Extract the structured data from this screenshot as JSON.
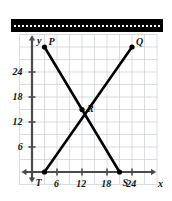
{
  "figure": {
    "title": "",
    "x_axis_label": "x",
    "y_axis_label": "y",
    "redaction_bar": {
      "present": true,
      "color": "#000000",
      "style": "dashed-white-inner-line"
    }
  },
  "chart_data": {
    "type": "scatter",
    "title": "",
    "xlabel": "x",
    "ylabel": "y",
    "xlim": [
      -3,
      30
    ],
    "ylim": [
      -3,
      33
    ],
    "xticks": [
      6,
      12,
      18,
      24
    ],
    "yticks": [
      6,
      12,
      18,
      24
    ],
    "xtick_labels": [
      "6",
      "12",
      "18",
      "24"
    ],
    "ytick_labels": [
      "6",
      "12",
      "18",
      "24"
    ],
    "grid": true,
    "grid_step": 3,
    "grid_color": "#c8cdd2",
    "axis_color": "#4a4a4a",
    "legend": "none",
    "points": [
      {
        "name": "P",
        "x": 3,
        "y": 30,
        "label_dx": 4,
        "label_dy": 10
      },
      {
        "name": "Q",
        "x": 24,
        "y": 30,
        "label_dx": 4,
        "label_dy": 10
      },
      {
        "name": "R",
        "x": 12,
        "y": 15,
        "label_dx": 5,
        "label_dy": 6
      },
      {
        "name": "T",
        "x": 3,
        "y": 0,
        "label_dx": -9,
        "label_dy": -6
      },
      {
        "name": "S",
        "x": 21,
        "y": 0,
        "label_dx": 3,
        "label_dy": -6
      }
    ],
    "series": [
      {
        "name": "segment-PS",
        "from": "P",
        "to": "S",
        "x": [
          3,
          21
        ],
        "y": [
          30,
          0
        ],
        "color": "#000000"
      },
      {
        "name": "segment-TQ",
        "from": "T",
        "to": "Q",
        "x": [
          3,
          24
        ],
        "y": [
          0,
          30
        ],
        "color": "#000000"
      }
    ],
    "annotations": [
      {
        "text": "P",
        "x": 3,
        "y": 30
      },
      {
        "text": "Q",
        "x": 24,
        "y": 30
      },
      {
        "text": "R",
        "x": 12,
        "y": 15
      },
      {
        "text": "T",
        "x": 3,
        "y": 0
      },
      {
        "text": "S",
        "x": 21,
        "y": 0
      }
    ]
  }
}
